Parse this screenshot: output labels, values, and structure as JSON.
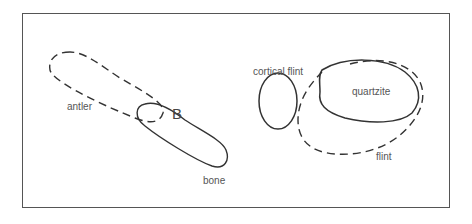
{
  "diagram": {
    "type": "cluster-outline plot",
    "groups": [
      {
        "name": "antler",
        "label": "antler",
        "outline": "dashed"
      },
      {
        "name": "bone",
        "label": "bone",
        "outline": "solid"
      },
      {
        "name": "cortical-flint",
        "label": "cortical flint",
        "outline": "solid"
      },
      {
        "name": "quartzite",
        "label": "quartzite",
        "outline": "solid"
      },
      {
        "name": "flint",
        "label": "flint",
        "outline": "dashed"
      }
    ],
    "marker_label": "B",
    "colors": {
      "line": "#333333",
      "frame": "#555555",
      "text": "#555555"
    }
  }
}
